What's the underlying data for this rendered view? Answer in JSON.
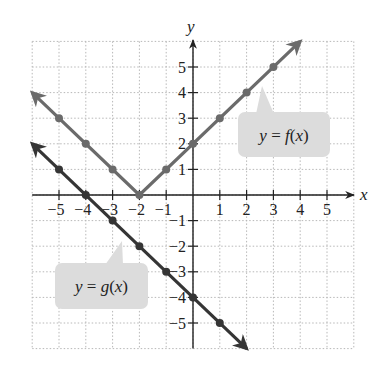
{
  "chart_data": {
    "type": "line",
    "title": "",
    "xlabel": "x",
    "ylabel": "y",
    "xlim": [
      -6,
      6
    ],
    "ylim": [
      -6,
      6
    ],
    "grid": true,
    "grid_style": "dotted",
    "x_ticks": [
      -5,
      -4,
      -3,
      -2,
      -1,
      1,
      2,
      3,
      4,
      5
    ],
    "y_ticks": [
      -5,
      -4,
      -3,
      -2,
      -1,
      1,
      2,
      3,
      4,
      5
    ],
    "x_tick_labels": [
      "−5",
      "−4",
      "−3",
      "−2",
      "−1",
      "1",
      "2",
      "3",
      "4",
      "5"
    ],
    "y_tick_labels": [
      "−5",
      "−4",
      "−3",
      "−2",
      "−1",
      "1",
      "2",
      "3",
      "4",
      "5"
    ],
    "series": [
      {
        "name": "y = f(x)",
        "color": "#6b6b6b",
        "line_start": [
          -6,
          4
        ],
        "line_end": [
          4,
          6
        ],
        "vertex": [
          -2,
          0
        ],
        "arrows": "both",
        "points": [
          [
            -5,
            3
          ],
          [
            -4,
            2
          ],
          [
            -3,
            1
          ],
          [
            -2,
            0
          ],
          [
            -1,
            1
          ],
          [
            0,
            2
          ],
          [
            1,
            3
          ],
          [
            2,
            4
          ],
          [
            3,
            5
          ]
        ],
        "callout": {
          "text_prefix": "y",
          "text_eq": " = ",
          "text_fn": "f",
          "text_arg": "(x)",
          "box": [
            238,
            112,
            92,
            45
          ],
          "pointer_tip": [
            262,
            86
          ]
        }
      },
      {
        "name": "y = g(x)",
        "color": "#353535",
        "line_start": [
          -6,
          2
        ],
        "line_end": [
          2,
          -6
        ],
        "arrows": "both",
        "points": [
          [
            -5,
            1
          ],
          [
            -4,
            0
          ],
          [
            -3,
            -1
          ],
          [
            -2,
            -2
          ],
          [
            -1,
            -3
          ],
          [
            0,
            -4
          ],
          [
            1,
            -5
          ]
        ],
        "callout": {
          "text_prefix": "y",
          "text_eq": " = ",
          "text_fn": "g",
          "text_arg": "(x)",
          "box": [
            55,
            263,
            93,
            46
          ],
          "pointer_tip": [
            122,
            241
          ]
        }
      }
    ]
  },
  "labels": {
    "x_axis": "x",
    "y_axis": "y",
    "f_callout": "y = f(x)",
    "g_callout": "y = g(x)"
  }
}
